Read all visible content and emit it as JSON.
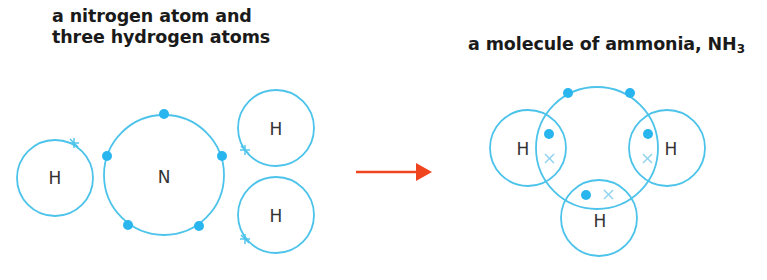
{
  "left_panel": {
    "caption_line1": "a nitrogen atom and",
    "caption_line2": "three hydrogen atoms",
    "atoms": [
      {
        "symbol": "H",
        "role": "hydrogen-left"
      },
      {
        "symbol": "N",
        "role": "nitrogen",
        "outer_electrons": 5
      },
      {
        "symbol": "H",
        "role": "hydrogen-top-right"
      },
      {
        "symbol": "H",
        "role": "hydrogen-bottom-right"
      }
    ]
  },
  "arrow": {
    "color": "#f0441e",
    "direction": "right"
  },
  "right_panel": {
    "caption_main": "a molecule of ammonia, NH",
    "caption_sub": "3",
    "atoms": [
      {
        "symbol": "H",
        "role": "hydrogen-left"
      },
      {
        "symbol": "H",
        "role": "hydrogen-right"
      },
      {
        "symbol": "H",
        "role": "hydrogen-bottom"
      }
    ],
    "lone_pair_electrons": 2,
    "shared_pairs": 3
  },
  "colors": {
    "shell": "#4cc3ea",
    "nitrogen_electron": "#29b6ef",
    "hydrogen_electron": "#8fd3ef",
    "text": "#1a1a1a",
    "arrow": "#f0441e"
  }
}
